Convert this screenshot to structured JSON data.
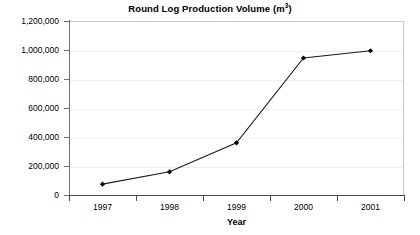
{
  "chart_data": {
    "type": "line",
    "title": "Round Log Production Volume (m",
    "title_superscript": "3",
    "title_suffix": ")",
    "title_full": "Round Log Production Volume (m3)",
    "categories": [
      "1997",
      "1998",
      "1999",
      "2000",
      "2001"
    ],
    "values": [
      75000,
      160000,
      360000,
      945000,
      995000
    ],
    "series": [
      {
        "name": "Round log production volume",
        "values": [
          75000,
          160000,
          360000,
          945000,
          995000
        ]
      }
    ],
    "xlabel": "Year",
    "ylabel": "",
    "ylim": [
      0,
      1200000
    ],
    "ytick_step": 200000,
    "ytick_labels": [
      "1,200,000",
      "1,000,000",
      "800,000",
      "600,000",
      "400,000",
      "200,000",
      "0"
    ],
    "ytick_values": [
      1200000,
      1000000,
      800000,
      600000,
      400000,
      200000,
      0
    ],
    "grid": true,
    "grid_axis": "y",
    "legend": false,
    "legend_position": "none",
    "marker": "diamond",
    "line_color": "#1a1a1a",
    "marker_color": "#000000",
    "grid_color": "#ededed",
    "axis_color": "#4a4a4a",
    "background_color": "#ffffff",
    "units": "m3"
  }
}
